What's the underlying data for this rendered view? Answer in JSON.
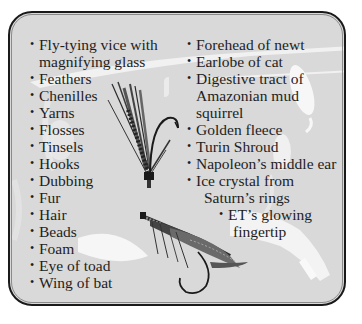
{
  "list_left": {
    "items": [
      {
        "lines": [
          "Fly-tying vice with",
          "magnifying glass"
        ]
      },
      {
        "lines": [
          "Feathers"
        ]
      },
      {
        "lines": [
          "Chenilles"
        ]
      },
      {
        "lines": [
          "Yarns"
        ]
      },
      {
        "lines": [
          "Flosses"
        ]
      },
      {
        "lines": [
          "Tinsels"
        ]
      },
      {
        "lines": [
          "Hooks"
        ]
      },
      {
        "lines": [
          "Dubbing"
        ]
      },
      {
        "lines": [
          "Fur"
        ]
      },
      {
        "lines": [
          "Hair"
        ]
      },
      {
        "lines": [
          "Beads"
        ]
      },
      {
        "lines": [
          "Foam"
        ]
      },
      {
        "lines": [
          "Eye of toad"
        ]
      },
      {
        "lines": [
          "Wing of bat"
        ]
      }
    ]
  },
  "list_right": {
    "items": [
      {
        "lines": [
          "Forehead of newt"
        ]
      },
      {
        "lines": [
          "Earlobe of cat"
        ]
      },
      {
        "lines": [
          "Digestive tract of",
          "Amazonian mud",
          "squirrel"
        ]
      },
      {
        "lines": [
          "Golden fleece"
        ]
      },
      {
        "lines": [
          "Turin Shroud"
        ]
      },
      {
        "lines": [
          "Napoleon’s middle ear"
        ]
      },
      {
        "lines": [
          "Ice crystal from",
          "Saturn’s rings"
        ]
      }
    ],
    "sub_items": [
      {
        "lines": [
          "ET’s glowing",
          "fingertip"
        ]
      }
    ]
  },
  "bullet_glyph": "•",
  "illustrations": [
    "fly-lure-upright",
    "fly-lure-horizontal",
    "ghost-lures-background"
  ],
  "colors": {
    "panel_bg": "#d9d9d9",
    "border": "#1a1a1a",
    "text": "#1e1e1e"
  }
}
